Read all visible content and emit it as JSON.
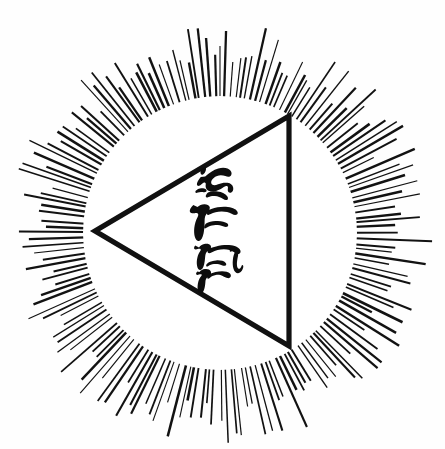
{
  "artwork": {
    "title": "Radiant Triangle Emblem",
    "caption": "",
    "medium": "ink drawing",
    "background_color": "#fefefe",
    "ink_color": "#111111"
  },
  "canvas": {
    "width": 445,
    "height": 449
  },
  "sunburst": {
    "name": "radiating rays halo",
    "center_x": 220,
    "center_y": 233,
    "inner_radius": 138,
    "outer_radius_min": 168,
    "outer_radius_max": 212,
    "ray_count": 168,
    "stroke_color": "#121212",
    "stroke_width_min": 1.1,
    "stroke_width_max": 2.6
  },
  "inner_disc": {
    "name": "white field inside halo",
    "radius": 137,
    "fill": "#ffffff"
  },
  "triangle": {
    "name": "left pointing triangle",
    "orientation": "apex-left",
    "stroke_color": "#111111",
    "stroke_width": 5.2,
    "vertices": [
      {
        "label": "left apex",
        "x": 95,
        "y": 231
      },
      {
        "label": "top right",
        "x": 289,
        "y": 116
      },
      {
        "label": "bottom right",
        "x": 289,
        "y": 346
      }
    ]
  },
  "glyphs": {
    "name": "inscribed calligraphic characters",
    "script": "hebrew-like brush strokes",
    "count": 4,
    "fill": "#0d0d0d",
    "items": [
      {
        "index": 1,
        "position": "top",
        "x": 196,
        "y": 172
      },
      {
        "index": 2,
        "position": "upper-middle",
        "x": 196,
        "y": 213
      },
      {
        "index": 3,
        "position": "lower-middle",
        "x": 198,
        "y": 247
      },
      {
        "index": 4,
        "position": "bottom",
        "x": 199,
        "y": 272
      }
    ]
  }
}
